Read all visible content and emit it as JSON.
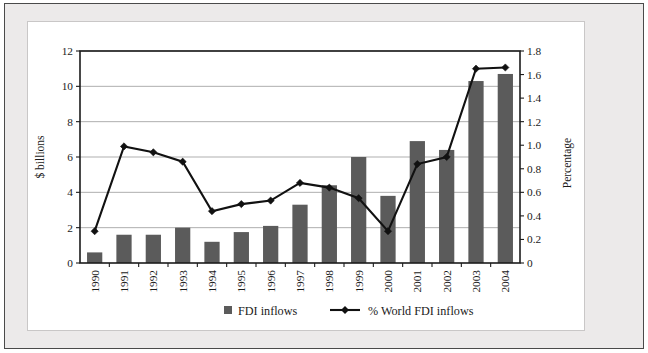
{
  "chart_data": {
    "type": "bar",
    "title": "",
    "subtitle": "",
    "xlabel": "",
    "ylabel": "$ billions",
    "y2label": "Percentage",
    "categories": [
      "1990",
      "1991",
      "1992",
      "1993",
      "1994",
      "1995",
      "1996",
      "1997",
      "1998",
      "1999",
      "2000",
      "2001",
      "2002",
      "2003",
      "2004"
    ],
    "ylim": [
      0,
      12
    ],
    "yticks": [
      "0",
      "2",
      "4",
      "6",
      "8",
      "10",
      "12"
    ],
    "y2lim": [
      0,
      1.8
    ],
    "y2ticks": [
      "0",
      "0.2",
      "0.4",
      "0.6",
      "0.8",
      "1.0",
      "1.2",
      "1.4",
      "1.6",
      "1.8"
    ],
    "grid": true,
    "legend_position": "bottom",
    "series": [
      {
        "name": "FDI inflows",
        "type": "bar",
        "axis": "left",
        "color": "#5b5b5b",
        "values": [
          0.6,
          1.6,
          1.6,
          2.0,
          1.2,
          1.75,
          2.1,
          3.3,
          4.4,
          6.0,
          3.8,
          6.9,
          6.4,
          10.3,
          10.7
        ]
      },
      {
        "name": "% World FDI inflows",
        "type": "line",
        "axis": "right",
        "color": "#111111",
        "marker": "diamond",
        "values": [
          0.27,
          0.99,
          0.94,
          0.86,
          0.44,
          0.5,
          0.53,
          0.68,
          0.64,
          0.55,
          0.27,
          0.84,
          0.9,
          1.65,
          1.66
        ]
      }
    ]
  },
  "legend": {
    "items": [
      {
        "label": "FDI inflows",
        "marker": "square",
        "color": "#5b5b5b"
      },
      {
        "label": "% World FDI inflows",
        "marker": "line-diamond",
        "color": "#111111"
      }
    ]
  },
  "axes": {
    "left_title": "$ billions",
    "right_title": "Percentage"
  }
}
